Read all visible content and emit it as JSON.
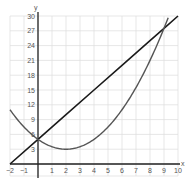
{
  "chart_data": {
    "type": "line",
    "title": "",
    "xlabel": "x",
    "ylabel": "y",
    "xlim": [
      -2,
      10
    ],
    "ylim": [
      0,
      30
    ],
    "grid": true,
    "x_ticks": [
      -2,
      -1,
      1,
      2,
      3,
      4,
      5,
      6,
      7,
      8,
      9,
      10
    ],
    "y_ticks": [
      3,
      6,
      9,
      12,
      15,
      18,
      21,
      24,
      27,
      30
    ],
    "series": [
      {
        "name": "line",
        "color": "#1a1a1a",
        "equation": "y = 2.5x + 5",
        "x": [
          -2,
          0,
          2,
          4,
          6,
          8,
          9,
          10
        ],
        "y": [
          0,
          5,
          10,
          15,
          20,
          25,
          27.5,
          30
        ]
      },
      {
        "name": "parabola",
        "color": "#555555",
        "equation": "y = 0.5(x - 2)^2 + 3",
        "x": [
          -2,
          -1,
          0,
          1,
          2,
          3,
          4,
          5,
          6,
          7,
          8,
          9,
          9.3
        ],
        "y": [
          11,
          7.5,
          5,
          3.5,
          3,
          3.5,
          5,
          7.5,
          11,
          15.5,
          21,
          27.5,
          29.6
        ]
      }
    ],
    "legend": null
  }
}
